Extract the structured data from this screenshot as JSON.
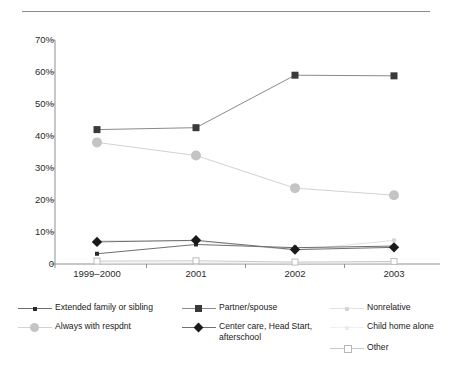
{
  "figure": {
    "has_top_rule": true,
    "background": "#ffffff"
  },
  "chart_data": {
    "type": "line",
    "title": "",
    "subtitle": "",
    "xlabel": "",
    "ylabel": "",
    "categories": [
      "1999–2000",
      "2001",
      "2002",
      "2003"
    ],
    "ytick_labels": [
      "70%",
      "60%",
      "50%",
      "40%",
      "30%",
      "20%",
      "10%",
      "0"
    ],
    "ytick_values": [
      70,
      60,
      50,
      40,
      30,
      20,
      10,
      0
    ],
    "ylim": [
      0,
      70
    ],
    "grid": false,
    "legend_position": "bottom",
    "series": [
      {
        "name": "Extended family or sibling",
        "marker": "small-square",
        "color": "#2b2b2b",
        "line_color": "#6f6f6f",
        "values": [
          3.2,
          6.1,
          5.1,
          5.6
        ]
      },
      {
        "name": "Partner/spouse",
        "marker": "square",
        "color": "#3a3a3a",
        "line_color": "#8a8a8a",
        "values": [
          42.0,
          42.6,
          59.0,
          58.8
        ]
      },
      {
        "name": "Nonrelative",
        "marker": "small-square",
        "color": "#d6d6d6",
        "line_color": "#e2e2e2",
        "values": [
          7.3,
          7.2,
          4.3,
          7.4
        ]
      },
      {
        "name": "Always with respdnt",
        "marker": "circle",
        "color": "#c4c4c4",
        "line_color": "#d2d2d2",
        "values": [
          38.0,
          33.9,
          23.7,
          21.5
        ]
      },
      {
        "name": "Center care, Head Start,\nafterschool",
        "marker": "diamond",
        "color": "#1a1a1a",
        "line_color": "#6f6f6f",
        "values": [
          6.9,
          7.4,
          4.5,
          5.2
        ]
      },
      {
        "name": "Child home alone",
        "marker": "small-square",
        "color": "#ececec",
        "line_color": "#efefef",
        "values": [
          0.3,
          0.4,
          0.3,
          0.4
        ]
      },
      {
        "name": "Other",
        "marker": "open-square",
        "color": "#ffffff",
        "line_color": "#c9c9c9",
        "values": [
          0.9,
          1.0,
          0.6,
          0.8
        ]
      }
    ]
  }
}
